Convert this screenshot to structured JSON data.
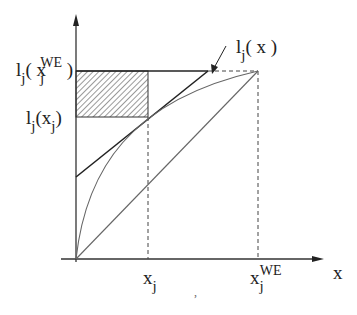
{
  "diagram": {
    "type": "economics-curve-diagram",
    "axes": {
      "x_label": "x",
      "y_axis": "vertical axis (unlabeled)"
    },
    "labels": {
      "y_top": {
        "func": "l",
        "sub": "j",
        "open": "( x",
        "arg_sub": "j",
        "arg_sup": "WE",
        "close": " )"
      },
      "y_mid": {
        "func": "l",
        "sub": "j",
        "open": "(x",
        "arg_sub": "j",
        "close": ")"
      },
      "curve": {
        "func": "l",
        "sub": "j",
        "text": "( x )"
      },
      "x_tick_1": {
        "base": "x",
        "sub": "j"
      },
      "x_tick_2": {
        "base": "x",
        "sub": "j",
        "sup": "WE"
      },
      "x_axis": "x",
      "stray_mark": ","
    },
    "elements": [
      "concave curve l_j(x) from origin to peak at (x_j^WE, l_j(x_j^WE))",
      "straight diagonal line from origin to peak",
      "tangent line at x_j forming triangle with horizontal at l_j(x_j^WE)",
      "hatched rectangle between l_j(x_j) and l_j(x_j^WE) from 0 to x_j",
      "dashed verticals at x_j and x_j^WE, dashed horizontal to peak",
      "arrow pointing from curve label to curve"
    ],
    "colors": {
      "ink": "#222222",
      "curve": "#666666",
      "hatch": "#555555",
      "background": "#ffffff"
    }
  }
}
